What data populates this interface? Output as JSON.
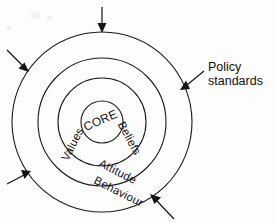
{
  "diagram": {
    "center": {
      "x": 102,
      "y": 122
    },
    "rings": [
      {
        "id": "core",
        "label": "CORE",
        "radius": 21,
        "label_x": 102,
        "label_y": 119,
        "label_rotation": -24,
        "font_size": 12
      },
      {
        "id": "values-beliefs",
        "label_left": "Values",
        "label_right": "Beliefs",
        "radius": 44,
        "left_label_x": 78,
        "left_label_y": 144,
        "left_label_rotation": -62,
        "right_label_x": 124,
        "right_label_y": 137,
        "right_label_rotation": 62,
        "font_size": 11.5
      },
      {
        "id": "attitude",
        "label": "Attitude",
        "radius": 64,
        "label_x": 113,
        "label_y": 175,
        "label_rotation": 28,
        "font_size": 11.5
      },
      {
        "id": "behaviour",
        "label": "Behaviour",
        "radius": 90,
        "label_x": 112,
        "label_y": 193,
        "label_rotation": 28,
        "font_size": 11.5
      }
    ],
    "arrows": [
      {
        "id": "arrow-top",
        "from_x": 102,
        "from_y": 7,
        "to_x": 102,
        "to_y": 32,
        "direction": "down"
      },
      {
        "id": "arrow-upper-left",
        "from_x": 8,
        "from_y": 51,
        "to_x": 27,
        "to_y": 70,
        "direction": "down-right"
      },
      {
        "id": "arrow-lower-left",
        "from_x": 9,
        "from_y": 183,
        "to_x": 28,
        "to_y": 172,
        "direction": "up-right"
      },
      {
        "id": "arrow-right",
        "from_x": 202,
        "from_y": 72,
        "to_x": 182,
        "to_y": 88,
        "direction": "down-left"
      },
      {
        "id": "arrow-bottom",
        "from_x": 172,
        "from_y": 217,
        "to_x": 152,
        "to_y": 196,
        "direction": "up-left"
      }
    ],
    "callout": {
      "line1": "Policy",
      "line2": "standards",
      "x": 208,
      "y": 60
    },
    "colors": {
      "stroke": "#1a1a1a",
      "text": "#101010",
      "background": "#fdfdfd"
    }
  }
}
